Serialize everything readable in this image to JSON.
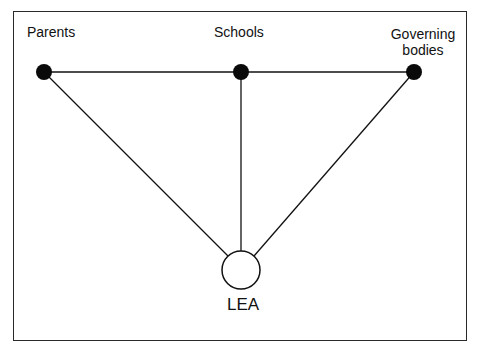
{
  "diagram": {
    "nodes": [
      {
        "id": "parents",
        "label": "Parents",
        "type": "filled-dot"
      },
      {
        "id": "schools",
        "label": "Schools",
        "type": "filled-dot"
      },
      {
        "id": "governing_bodies",
        "label": "Governing bodies",
        "label_lines": [
          "Governing",
          "bodies"
        ],
        "type": "filled-dot"
      },
      {
        "id": "lea",
        "label": "LEA",
        "type": "open-circle"
      }
    ],
    "edges": [
      {
        "from": "parents",
        "to": "schools"
      },
      {
        "from": "schools",
        "to": "governing_bodies"
      },
      {
        "from": "parents",
        "to": "lea"
      },
      {
        "from": "schools",
        "to": "lea"
      },
      {
        "from": "governing_bodies",
        "to": "lea"
      }
    ],
    "colors": {
      "line": "#111111",
      "dot": "#0a0a0a",
      "background": "#ffffff"
    }
  }
}
